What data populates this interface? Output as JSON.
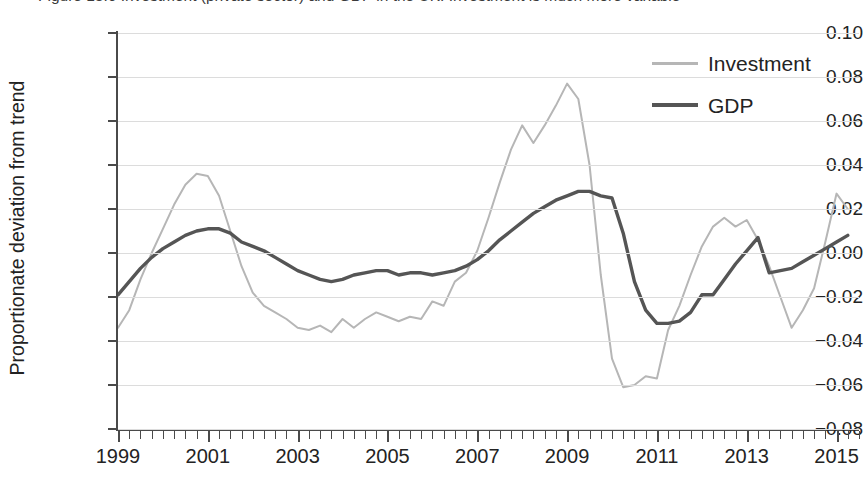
{
  "figure": {
    "caption_clipped": "Figure 13.6  Investment (private sector) and GDP in the UK: Investment is much more variable",
    "ylabel": "Proportionate deviation from trend"
  },
  "legend": {
    "position": "top-right",
    "items": [
      {
        "label": "Investment",
        "color": "#b6b6b6",
        "width": 2
      },
      {
        "label": "GDP",
        "color": "#555555",
        "width": 3.4
      }
    ]
  },
  "axes": {
    "y_ticks": [
      "0.10",
      "0.08",
      "0.06",
      "0.04",
      "0.02",
      "0.00",
      "-0.02",
      "-0.04",
      "-0.06",
      "-0.08"
    ],
    "y_tick_values": [
      0.1,
      0.08,
      0.06,
      0.04,
      0.02,
      0.0,
      -0.02,
      -0.04,
      -0.06,
      -0.08
    ],
    "x_tick_labels": [
      "1999",
      "2001",
      "2003",
      "2005",
      "2007",
      "2009",
      "2011",
      "2013",
      "2015"
    ],
    "x_tick_values": [
      1999,
      2001,
      2003,
      2005,
      2007,
      2009,
      2011,
      2013,
      2015
    ],
    "x_minor_step_years": 0.25,
    "grid": "horizontal"
  },
  "chart_data": {
    "type": "line",
    "title": "Investment (private sector) and GDP in the UK: Investment is much more variable",
    "xlabel": "",
    "ylabel": "Proportionate deviation from trend",
    "xlim": [
      1999.0,
      2015.5
    ],
    "ylim": [
      -0.08,
      0.1
    ],
    "grid": true,
    "legend_position": "top-right",
    "x": [
      1999.0,
      1999.25,
      1999.5,
      1999.75,
      2000.0,
      2000.25,
      2000.5,
      2000.75,
      2001.0,
      2001.25,
      2001.5,
      2001.75,
      2002.0,
      2002.25,
      2002.5,
      2002.75,
      2003.0,
      2003.25,
      2003.5,
      2003.75,
      2004.0,
      2004.25,
      2004.5,
      2004.75,
      2005.0,
      2005.25,
      2005.5,
      2005.75,
      2006.0,
      2006.25,
      2006.5,
      2006.75,
      2007.0,
      2007.25,
      2007.5,
      2007.75,
      2008.0,
      2008.25,
      2008.5,
      2008.75,
      2009.0,
      2009.25,
      2009.5,
      2009.75,
      2010.0,
      2010.25,
      2010.5,
      2010.75,
      2011.0,
      2011.25,
      2011.5,
      2011.75,
      2012.0,
      2012.25,
      2012.5,
      2012.75,
      2013.0,
      2013.25,
      2013.5,
      2013.75,
      2014.0,
      2014.25,
      2014.5,
      2014.75,
      2015.0,
      2015.25
    ],
    "series": [
      {
        "name": "Investment",
        "color": "#b6b6b6",
        "values": [
          -0.034,
          -0.026,
          -0.012,
          0.0,
          0.011,
          0.022,
          0.031,
          0.036,
          0.035,
          0.026,
          0.01,
          -0.006,
          -0.018,
          -0.024,
          -0.027,
          -0.03,
          -0.034,
          -0.035,
          -0.033,
          -0.036,
          -0.03,
          -0.034,
          -0.03,
          -0.027,
          -0.029,
          -0.031,
          -0.029,
          -0.03,
          -0.022,
          -0.024,
          -0.013,
          -0.009,
          0.001,
          0.016,
          0.032,
          0.047,
          0.058,
          0.05,
          0.058,
          0.067,
          0.077,
          0.07,
          0.04,
          -0.01,
          -0.048,
          -0.061,
          -0.06,
          -0.056,
          -0.057,
          -0.035,
          -0.024,
          -0.01,
          0.003,
          0.012,
          0.016,
          0.012,
          0.015,
          0.006,
          -0.006,
          -0.02,
          -0.034,
          -0.026,
          -0.016,
          -0.009,
          0.002,
          0.008
        ]
      },
      {
        "name": "GDP",
        "color": "#555555",
        "values": [
          -0.019,
          -0.013,
          -0.007,
          -0.002,
          0.002,
          0.005,
          0.008,
          0.01,
          0.011,
          0.011,
          0.009,
          0.005,
          0.003,
          0.001,
          -0.002,
          -0.005,
          -0.008,
          -0.01,
          -0.012,
          -0.013,
          -0.012,
          -0.01,
          -0.009,
          -0.008,
          -0.008,
          -0.01,
          -0.009,
          -0.009,
          -0.01,
          -0.009,
          -0.008,
          -0.006,
          -0.003,
          0.001,
          0.006,
          0.01,
          0.014,
          0.018,
          0.021,
          0.024,
          0.026,
          0.028,
          0.028,
          0.026,
          0.025,
          0.009,
          -0.013,
          -0.026,
          -0.032,
          -0.032,
          -0.031,
          -0.027,
          -0.019,
          -0.019,
          -0.012,
          -0.005,
          0.001,
          0.007,
          0.009,
          0.008,
          0.005,
          0.001,
          -0.003,
          -0.007,
          -0.009,
          -0.009
        ]
      }
    ],
    "gdp_tail": {
      "x": [
        2013.5,
        2013.75,
        2014.0,
        2014.25,
        2014.5,
        2014.75,
        2015.0,
        2015.25
      ],
      "values": [
        -0.009,
        -0.008,
        -0.007,
        -0.004,
        -0.001,
        0.002,
        0.005,
        0.008
      ]
    },
    "investment_tail": {
      "x": [
        2014.75,
        2015.0,
        2015.25
      ],
      "values": [
        0.005,
        0.027,
        0.02
      ]
    }
  }
}
